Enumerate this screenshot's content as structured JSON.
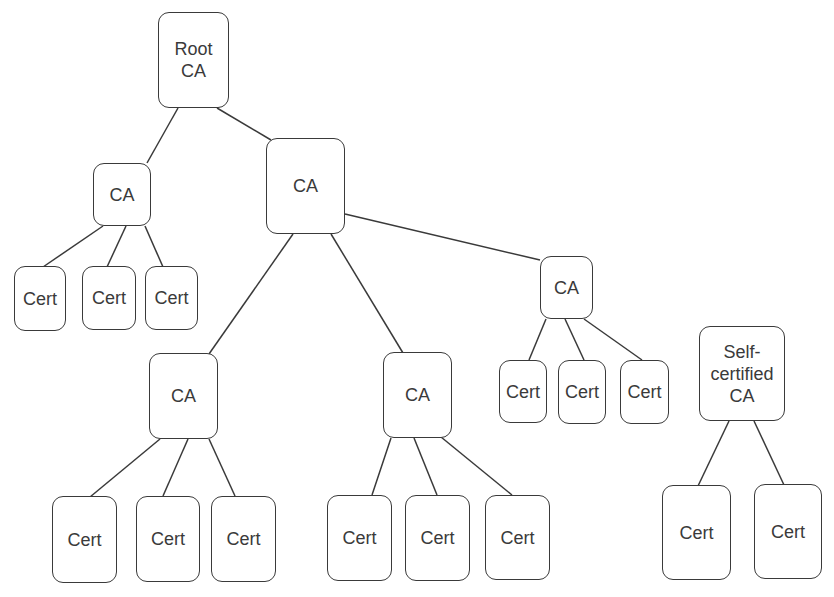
{
  "diagram": {
    "title": "",
    "type": "certificate-authority-hierarchy",
    "stroke_color": "#3a3a3a",
    "background": "#ffffff",
    "nodes": [
      {
        "id": "root",
        "label": "Root\nCA",
        "kind": "ca",
        "box": [
          158,
          12,
          71,
          96
        ]
      },
      {
        "id": "ca_l",
        "label": "CA",
        "kind": "ca",
        "box": [
          93,
          163,
          58,
          63
        ]
      },
      {
        "id": "ca_m",
        "label": "CA",
        "kind": "ca",
        "box": [
          266,
          138,
          79,
          96
        ]
      },
      {
        "id": "ca_r",
        "label": "CA",
        "kind": "ca",
        "box": [
          540,
          256,
          53,
          63
        ]
      },
      {
        "id": "ca_bl",
        "label": "CA",
        "kind": "ca",
        "box": [
          149,
          353,
          69,
          86
        ]
      },
      {
        "id": "ca_bm",
        "label": "CA",
        "kind": "ca",
        "box": [
          383,
          352,
          69,
          86
        ]
      },
      {
        "id": "self",
        "label": "Self-\ncertified\nCA",
        "kind": "self-certified-ca",
        "box": [
          699,
          326,
          86,
          95
        ]
      },
      {
        "id": "c1",
        "label": "Cert",
        "kind": "cert",
        "box": [
          14,
          266,
          52,
          65
        ]
      },
      {
        "id": "c2",
        "label": "Cert",
        "kind": "cert",
        "box": [
          82,
          266,
          54,
          64
        ]
      },
      {
        "id": "c3",
        "label": "Cert",
        "kind": "cert",
        "box": [
          145,
          266,
          53,
          64
        ]
      },
      {
        "id": "c4",
        "label": "Cert",
        "kind": "cert",
        "box": [
          499,
          360,
          48,
          63
        ]
      },
      {
        "id": "c5",
        "label": "Cert",
        "kind": "cert",
        "box": [
          558,
          360,
          48,
          64
        ]
      },
      {
        "id": "c6",
        "label": "Cert",
        "kind": "cert",
        "box": [
          620,
          360,
          49,
          64
        ]
      },
      {
        "id": "c7",
        "label": "Cert",
        "kind": "cert",
        "box": [
          52,
          496,
          65,
          87
        ]
      },
      {
        "id": "c8",
        "label": "Cert",
        "kind": "cert",
        "box": [
          136,
          496,
          64,
          86
        ]
      },
      {
        "id": "c9",
        "label": "Cert",
        "kind": "cert",
        "box": [
          211,
          496,
          65,
          86
        ]
      },
      {
        "id": "c10",
        "label": "Cert",
        "kind": "cert",
        "box": [
          327,
          495,
          65,
          86
        ]
      },
      {
        "id": "c11",
        "label": "Cert",
        "kind": "cert",
        "box": [
          405,
          495,
          65,
          86
        ]
      },
      {
        "id": "c12",
        "label": "Cert",
        "kind": "cert",
        "box": [
          485,
          495,
          65,
          85
        ]
      },
      {
        "id": "c13",
        "label": "Cert",
        "kind": "cert",
        "box": [
          662,
          485,
          69,
          95
        ]
      },
      {
        "id": "c14",
        "label": "Cert",
        "kind": "cert",
        "box": [
          754,
          484,
          68,
          95
        ]
      }
    ],
    "edges": [
      {
        "from": "root",
        "to": "ca_l",
        "line": [
          178,
          108,
          147,
          163
        ]
      },
      {
        "from": "root",
        "to": "ca_m",
        "line": [
          217,
          108,
          271,
          140
        ]
      },
      {
        "from": "ca_l",
        "to": "c1",
        "line": [
          103,
          226,
          43,
          267
        ]
      },
      {
        "from": "ca_l",
        "to": "c2",
        "line": [
          126,
          226,
          107,
          267
        ]
      },
      {
        "from": "ca_l",
        "to": "c3",
        "line": [
          145,
          226,
          163,
          267
        ]
      },
      {
        "from": "ca_m",
        "to": "ca_bl",
        "line": [
          293,
          234,
          209,
          354
        ]
      },
      {
        "from": "ca_m",
        "to": "ca_bm",
        "line": [
          331,
          234,
          403,
          353
        ]
      },
      {
        "from": "ca_m",
        "to": "ca_r",
        "line": [
          345,
          214,
          540,
          260
        ]
      },
      {
        "from": "ca_r",
        "to": "c4",
        "line": [
          546,
          319,
          529,
          360
        ]
      },
      {
        "from": "ca_r",
        "to": "c5",
        "line": [
          565,
          319,
          584,
          360
        ]
      },
      {
        "from": "ca_r",
        "to": "c6",
        "line": [
          584,
          319,
          642,
          360
        ]
      },
      {
        "from": "ca_bl",
        "to": "c7",
        "line": [
          160,
          439,
          90,
          497
        ]
      },
      {
        "from": "ca_bl",
        "to": "c8",
        "line": [
          188,
          439,
          163,
          496
        ]
      },
      {
        "from": "ca_bl",
        "to": "c9",
        "line": [
          209,
          439,
          235,
          496
        ]
      },
      {
        "from": "ca_bm",
        "to": "c10",
        "line": [
          391,
          438,
          372,
          495
        ]
      },
      {
        "from": "ca_bm",
        "to": "c11",
        "line": [
          414,
          438,
          437,
          495
        ]
      },
      {
        "from": "ca_bm",
        "to": "c12",
        "line": [
          441,
          437,
          512,
          495
        ]
      },
      {
        "from": "self",
        "to": "c13",
        "line": [
          729,
          421,
          698,
          486
        ]
      },
      {
        "from": "self",
        "to": "c14",
        "line": [
          754,
          421,
          784,
          485
        ]
      }
    ]
  }
}
